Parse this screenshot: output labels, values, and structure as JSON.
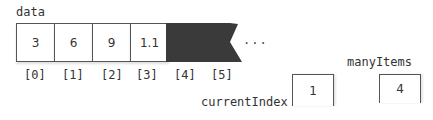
{
  "array": {
    "name": "data",
    "values": [
      "3",
      "6",
      "9",
      "1.1"
    ],
    "indices": [
      "[0]",
      "[1]",
      "[2]",
      "[3]",
      "[4]",
      "[5]"
    ],
    "ellipsis": "...",
    "unused_fill_color": "#3a3a3a"
  },
  "variables": {
    "currentIndex": {
      "name": "currentIndex",
      "value": "1"
    },
    "manyItems": {
      "name": "manyItems",
      "value": "4"
    }
  }
}
